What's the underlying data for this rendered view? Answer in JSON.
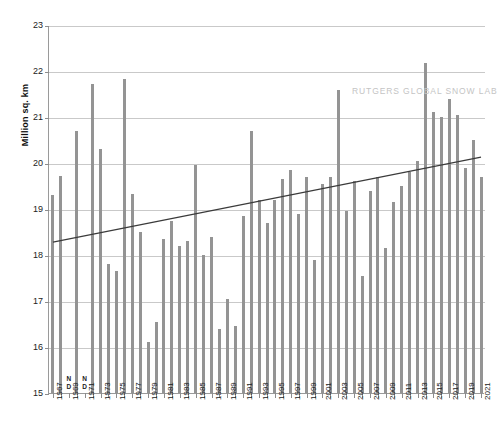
{
  "watermark": "RUTGERS GLOBAL SNOW LAB",
  "chart_data": {
    "type": "bar",
    "title": "",
    "subtitle": "",
    "xlabel": "",
    "ylabel": "Million sq. km",
    "ylim": [
      15,
      23
    ],
    "ytick_labels": [
      "23",
      "22",
      "21",
      "20",
      "19",
      "18",
      "17",
      "16",
      "15"
    ],
    "yticks": [
      23,
      22,
      21,
      20,
      19,
      18,
      17,
      16,
      15
    ],
    "grid": true,
    "legend": "none",
    "no_data_label": "N\nD",
    "bar_color": "#949494",
    "trendline_color": "#3b3b3b",
    "categories": [
      "1967",
      "1968",
      "1969",
      "1970",
      "1971",
      "1972",
      "1973",
      "1974",
      "1975",
      "1976",
      "1977",
      "1978",
      "1979",
      "1980",
      "1981",
      "1982",
      "1983",
      "1984",
      "1985",
      "1986",
      "1987",
      "1988",
      "1989",
      "1990",
      "1991",
      "1992",
      "1993",
      "1994",
      "1995",
      "1996",
      "1997",
      "1998",
      "1999",
      "2000",
      "2001",
      "2002",
      "2003",
      "2004",
      "2005",
      "2006",
      "2007",
      "2008",
      "2009",
      "2010",
      "2011",
      "2012",
      "2013",
      "2014",
      "2015",
      "2016",
      "2017",
      "2018",
      "2019",
      "2020",
      "2021"
    ],
    "xtick_labels": [
      "1967",
      "1969",
      "1971",
      "1973",
      "1975",
      "1977",
      "1979",
      "1981",
      "1983",
      "1985",
      "1987",
      "1989",
      "1991",
      "1993",
      "1995",
      "1997",
      "1999",
      "2001",
      "2003",
      "2005",
      "2007",
      "2009",
      "2011",
      "2013",
      "2015",
      "2017",
      "2019",
      "2021"
    ],
    "values": [
      19.3,
      19.72,
      null,
      20.7,
      null,
      21.72,
      20.3,
      17.8,
      17.65,
      21.83,
      19.32,
      18.5,
      16.1,
      16.55,
      18.35,
      18.75,
      18.2,
      18.3,
      19.95,
      18.0,
      18.4,
      16.4,
      17.05,
      16.45,
      18.85,
      20.7,
      19.2,
      18.7,
      19.2,
      19.65,
      19.85,
      18.9,
      19.7,
      17.9,
      19.55,
      19.7,
      21.58,
      18.95,
      19.6,
      17.55,
      19.4,
      19.7,
      18.15,
      19.15,
      19.5,
      19.8,
      20.05,
      22.18,
      21.1,
      21.0,
      21.4,
      21.05,
      19.9,
      20.5,
      19.7
    ],
    "no_data_years": [
      "1969",
      "1971"
    ],
    "trendline": {
      "start": {
        "x": "1967",
        "y": 18.3
      },
      "end": {
        "x": "2021",
        "y": 20.15
      }
    }
  }
}
